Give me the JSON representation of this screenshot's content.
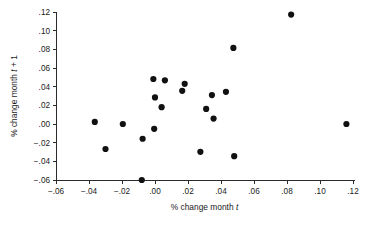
{
  "chart_data": {
    "type": "scatter",
    "title": "",
    "xlabel": "% change month t",
    "ylabel": "% change month t + 1",
    "xlabel_parts": {
      "prefix": "% change month ",
      "italic": "t",
      "suffix": ""
    },
    "ylabel_parts": {
      "prefix": "% change month ",
      "italic": "t",
      "suffix": " + 1"
    },
    "xlim": [
      -0.06,
      0.12
    ],
    "ylim": [
      -0.06,
      0.12
    ],
    "xticks": [
      -0.06,
      -0.04,
      -0.02,
      0.0,
      0.02,
      0.04,
      0.06,
      0.08,
      0.1,
      0.12
    ],
    "yticks": [
      -0.06,
      -0.04,
      -0.02,
      0.0,
      0.02,
      0.04,
      0.06,
      0.08,
      0.1,
      0.12
    ],
    "xtick_labels": [
      "−.06",
      "−.04",
      "−.02",
      ".00",
      ".02",
      ".04",
      ".06",
      ".08",
      ".10",
      ".12"
    ],
    "ytick_labels": [
      "−.06",
      "−.04",
      "−.02",
      ".00",
      ".02",
      ".04",
      ".06",
      ".08",
      ".10",
      ".12"
    ],
    "grid": false,
    "legend": null,
    "marker": {
      "shape": "circle",
      "color": "#111111",
      "size_px": 3.1
    },
    "points": [
      {
        "x": -0.0365,
        "y": 0.0022
      },
      {
        "x": -0.03,
        "y": -0.0268
      },
      {
        "x": -0.0195,
        "y": 0.0
      },
      {
        "x": -0.008,
        "y": -0.06
      },
      {
        "x": -0.0075,
        "y": -0.0158
      },
      {
        "x": -0.001,
        "y": 0.0482
      },
      {
        "x": 0.0,
        "y": 0.0285
      },
      {
        "x": -0.0005,
        "y": -0.0052
      },
      {
        "x": 0.004,
        "y": 0.018
      },
      {
        "x": 0.006,
        "y": 0.0468
      },
      {
        "x": 0.0165,
        "y": 0.0355
      },
      {
        "x": 0.018,
        "y": 0.043
      },
      {
        "x": 0.0275,
        "y": -0.0298
      },
      {
        "x": 0.031,
        "y": 0.0162
      },
      {
        "x": 0.0345,
        "y": 0.031
      },
      {
        "x": 0.0355,
        "y": 0.0058
      },
      {
        "x": 0.043,
        "y": 0.0345
      },
      {
        "x": 0.0475,
        "y": 0.0815
      },
      {
        "x": 0.048,
        "y": -0.0345
      },
      {
        "x": 0.0825,
        "y": 0.1172
      },
      {
        "x": 0.116,
        "y": 0.0
      }
    ]
  },
  "axes": {
    "x_axis_name": "x-axis",
    "y_axis_name": "y-axis"
  }
}
